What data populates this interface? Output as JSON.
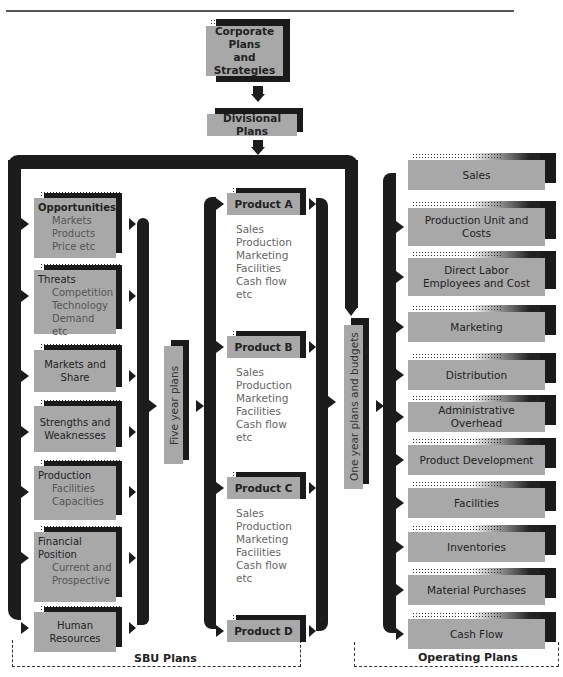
{
  "top": {
    "corporate": "Corporate Plans and Strategies",
    "corporate_lines": [
      "Corporate",
      "Plans",
      "and Strategies"
    ],
    "divisional": "Divisional Plans"
  },
  "sbu": {
    "group_label": "SBU Plans",
    "items": [
      {
        "title": "Opportunities",
        "subs": [
          "Markets",
          "Products",
          "Price etc"
        ]
      },
      {
        "title": "Threats",
        "subs": [
          "Competition",
          "Technology",
          "Demand etc"
        ]
      },
      {
        "title": "Markets and Share",
        "subs": []
      },
      {
        "title": "Strengths and Weaknesses",
        "subs": []
      },
      {
        "title": "Production",
        "subs": [
          "Facilities",
          "Capacities"
        ]
      },
      {
        "title": "Financial Position",
        "subs": [
          "Current and",
          "Prospective"
        ]
      },
      {
        "title": "Human Resources",
        "subs": []
      }
    ],
    "five_year": "Five year plans",
    "products": [
      {
        "name": "Product A",
        "items": [
          "Sales",
          "Production",
          "Marketing",
          "Facilities",
          "Cash flow",
          "etc"
        ]
      },
      {
        "name": "Product B",
        "items": [
          "Sales",
          "Production",
          "Marketing",
          "Facilities",
          "Cash flow",
          "etc"
        ]
      },
      {
        "name": "Product C",
        "items": [
          "Sales",
          "Production",
          "Marketing",
          "Facilities",
          "Cash flow",
          "etc"
        ]
      },
      {
        "name": "Product D",
        "items": []
      }
    ],
    "one_year": "One year plans and budgets"
  },
  "operating": {
    "group_label": "Operating Plans",
    "items": [
      "Sales",
      "Production Unit and Costs",
      "Direct Labor Employees and Cost",
      "Marketing",
      "Distribution",
      "Administrative Overhead",
      "Product Development",
      "Facilities",
      "Inventories",
      "Material Purchases",
      "Cash Flow"
    ]
  }
}
